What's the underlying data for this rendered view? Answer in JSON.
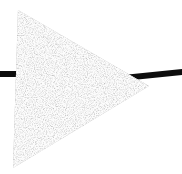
{
  "canvas": {
    "width": 182,
    "height": 174,
    "background_color": "#ffffff",
    "title": "Noise-filled triangle crossed by horizontal bar"
  },
  "shapes": {
    "bar": {
      "label": "horizontal-bar",
      "color": "#0d0d0d",
      "left_segment": {
        "x": 0,
        "y": 71,
        "width": 24,
        "height": 6
      },
      "right_segment": {
        "x": 130,
        "y": 69,
        "width": 52,
        "height": 6
      },
      "spans_full_width": "true",
      "occluded_by": "triangle"
    },
    "triangle": {
      "label": "right-pointing-triangle",
      "fill_style": "noise-dither",
      "fill_color": "#b4b4b4",
      "stroke_color": "none",
      "points": [
        {
          "name": "top-vertex",
          "x": 18,
          "y": 10
        },
        {
          "name": "right-apex",
          "x": 149,
          "y": 86
        },
        {
          "name": "bottom-vertex",
          "x": 13,
          "y": 168
        }
      ],
      "polygon_string": "18,10 149,86 13,168"
    }
  },
  "noise": {
    "seed": 1977,
    "cell_size": 1,
    "light_value": "#f0f0f0",
    "mid_value": "#b0b0b0",
    "dark_value": "#6a6a6a",
    "density": 0.58
  },
  "accessibility": {
    "alt_text": "A gray stippled triangle pointing right, overlapping a thin black horizontal line."
  }
}
